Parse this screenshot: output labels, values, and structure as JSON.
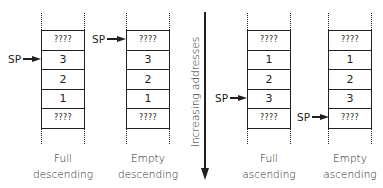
{
  "axis": {
    "label": "Increasing addresses",
    "direction": "down"
  },
  "stacks": [
    {
      "name": "full-descending",
      "label_line1": "Full",
      "label_line2": "descending",
      "cells": [
        "????",
        "3",
        "2",
        "1",
        "????"
      ],
      "sp_label": "SP",
      "sp_cell_index": 1
    },
    {
      "name": "empty-descending",
      "label_line1": "Empty",
      "label_line2": "descending",
      "cells": [
        "????",
        "3",
        "2",
        "1",
        "????"
      ],
      "sp_label": "SP",
      "sp_cell_index": 0
    },
    {
      "name": "full-ascending",
      "label_line1": "Full",
      "label_line2": "ascending",
      "cells": [
        "????",
        "1",
        "2",
        "3",
        "????"
      ],
      "sp_label": "SP",
      "sp_cell_index": 3
    },
    {
      "name": "empty-ascending",
      "label_line1": "Empty",
      "label_line2": "ascending",
      "cells": [
        "????",
        "1",
        "2",
        "3",
        "????"
      ],
      "sp_label": "SP",
      "sp_cell_index": 4
    }
  ]
}
